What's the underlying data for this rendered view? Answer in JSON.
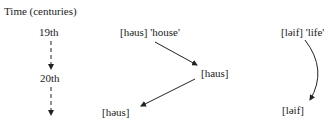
{
  "timeline": {
    "title": "Time (centuries)",
    "points": [
      "19th",
      "20th"
    ]
  },
  "house_path": {
    "start": "[həus] 'house'",
    "middle": "[haus]",
    "end": "[həus]"
  },
  "life_path": {
    "start": "[ləif] 'life'",
    "end": "[ləif]"
  }
}
